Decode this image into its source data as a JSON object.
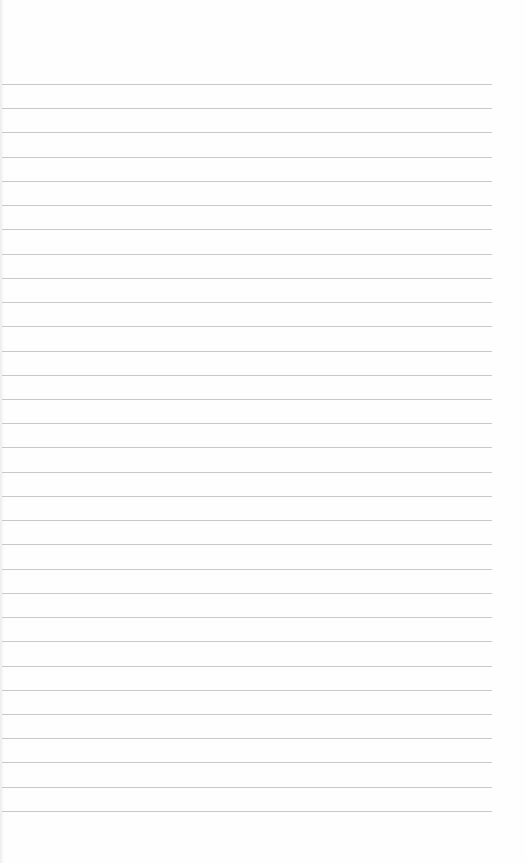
{
  "page": {
    "type": "lined-paper",
    "background": "#fefefe",
    "rule_color": "#c9c9c9",
    "rule_count": 31,
    "first_rule_y": 84,
    "rule_spacing": 24.23,
    "rule_left": 2,
    "rule_width": 490
  }
}
